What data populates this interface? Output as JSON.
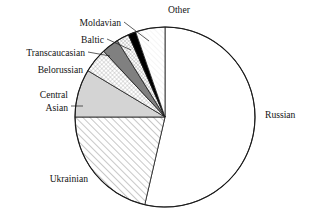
{
  "chart_data": {
    "type": "pie",
    "title": "",
    "subtitle": "",
    "xlabel": "",
    "ylabel": "",
    "legend_position": "labels-with-leader-lines",
    "grid": false,
    "start_angle_deg": 0,
    "direction": "clockwise",
    "center": {
      "x": 165,
      "y": 117
    },
    "radius": 90,
    "categories": [
      "Russian",
      "Ukrainian",
      "Central Asian",
      "Belorussian",
      "Transcaucasian",
      "Baltic",
      "Moldavian",
      "Other"
    ],
    "values": [
      53.6,
      21.4,
      8.6,
      4.4,
      3.1,
      2.2,
      1.4,
      5.3
    ],
    "units": "percent",
    "slices": [
      {
        "label": "Russian",
        "value": 53.6,
        "start_deg": 0.0,
        "end_deg": 193.0,
        "fill": "#ffffff",
        "pattern": "solid"
      },
      {
        "label": "Ukrainian",
        "value": 21.4,
        "start_deg": 193.0,
        "end_deg": 270.0,
        "fill": "#ffffff",
        "pattern": "diagonal-hatch"
      },
      {
        "label": "Central Asian",
        "value": 8.6,
        "start_deg": 270.0,
        "end_deg": 301.0,
        "fill": "#d4d4d4",
        "pattern": "solid"
      },
      {
        "label": "Belorussian",
        "value": 4.4,
        "start_deg": 301.0,
        "end_deg": 317.0,
        "fill": "#ffffff",
        "pattern": "crosshatch"
      },
      {
        "label": "Transcaucasian",
        "value": 3.1,
        "start_deg": 317.0,
        "end_deg": 328.0,
        "fill": "#808080",
        "pattern": "solid"
      },
      {
        "label": "Baltic",
        "value": 2.2,
        "start_deg": 328.0,
        "end_deg": 336.0,
        "fill": "#ffffff",
        "pattern": "fine-hatch"
      },
      {
        "label": "Moldavian",
        "value": 1.4,
        "start_deg": 336.0,
        "end_deg": 341.0,
        "fill": "#000000",
        "pattern": "solid"
      },
      {
        "label": "Other",
        "value": 5.3,
        "start_deg": 341.0,
        "end_deg": 360.0,
        "fill": "#fafafa",
        "pattern": "very-fine-hatch"
      }
    ],
    "annotations": [
      {
        "name": "other",
        "text": "Other",
        "x": 168,
        "y": 13,
        "anchor": "start"
      },
      {
        "name": "moldavian",
        "text": "Moldavian",
        "x": 121,
        "y": 26,
        "anchor": "end"
      },
      {
        "name": "baltic",
        "text": "Baltic",
        "x": 104,
        "y": 43,
        "anchor": "end"
      },
      {
        "name": "transcaucasian",
        "text": "Transcaucasian",
        "x": 85,
        "y": 56,
        "anchor": "end"
      },
      {
        "name": "belorussian",
        "text": "Belorussian",
        "x": 83,
        "y": 73,
        "anchor": "end"
      },
      {
        "name": "central",
        "text": "Central",
        "x": 68,
        "y": 98,
        "anchor": "end"
      },
      {
        "name": "asian",
        "text": "Asian",
        "x": 68,
        "y": 111,
        "anchor": "end"
      },
      {
        "name": "ukrainian",
        "text": "Ukrainian",
        "x": 88,
        "y": 182,
        "anchor": "end"
      },
      {
        "name": "russian",
        "text": "Russian",
        "x": 265,
        "y": 118,
        "anchor": "start"
      }
    ],
    "leader_lines": [
      {
        "name": "moldavian-leader",
        "x1": 124,
        "y1": 22,
        "x2": 149,
        "y2": 41
      },
      {
        "name": "baltic-leader",
        "x1": 107,
        "y1": 39,
        "x2": 131,
        "y2": 50
      },
      {
        "name": "transcaucasian-leader",
        "x1": 88,
        "y1": 52,
        "x2": 110,
        "y2": 56
      },
      {
        "name": "central-asian-leader",
        "x1": 71,
        "y1": 106,
        "x2": 83,
        "y2": 106
      }
    ]
  },
  "figure": {
    "background": "#ffffff",
    "stroke": "#1a1a1a"
  }
}
